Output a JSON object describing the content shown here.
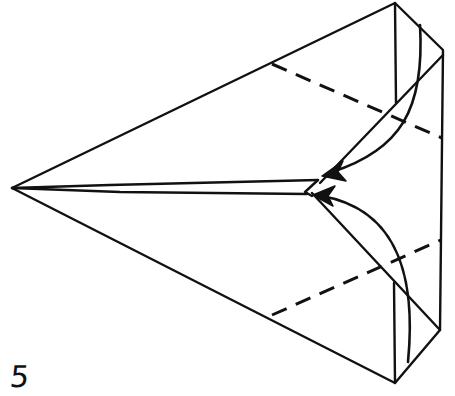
{
  "diagram": {
    "type": "origami-folding-step",
    "step_number": "5",
    "colors": {
      "ink": "#111111",
      "background": "#ffffff"
    },
    "elements": [
      "outline-kite",
      "valley-fold-line-upper",
      "valley-fold-line-lower",
      "fold-arrow-upper",
      "fold-arrow-lower",
      "center-flap"
    ]
  }
}
